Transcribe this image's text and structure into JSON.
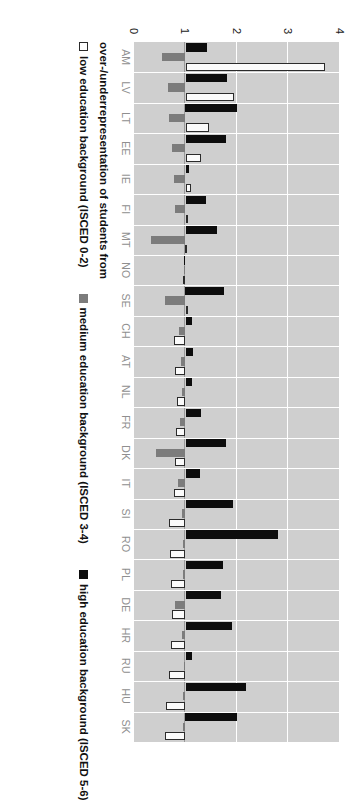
{
  "chart_data": {
    "type": "bar",
    "orientation": "rotated-vertical",
    "title": "",
    "xlabel": "",
    "ylabel": "over-/underrepresentation of students from",
    "axis_title": "over-/underrepresentation of students from",
    "ylim": [
      0,
      4
    ],
    "yticks": [
      0,
      1,
      2,
      3,
      4
    ],
    "ytick_labels": [
      "0",
      "1",
      "2",
      "3",
      "4"
    ],
    "grid": true,
    "baseline": 1,
    "legend_position": "bottom",
    "categories": [
      "AM",
      "LV",
      "LT",
      "EE",
      "IE",
      "FI",
      "MT",
      "NO",
      "SE",
      "CH",
      "AT",
      "NL",
      "FR",
      "DK",
      "IT",
      "SI",
      "RO",
      "PL",
      "DE",
      "HR",
      "RU",
      "HU",
      "SK"
    ],
    "series": [
      {
        "name": "low education background (ISCED 0-2)",
        "key": "low",
        "color": "#ffffff",
        "edge_color": "#2b2b2b",
        "values": [
          3.7,
          1.95,
          1.45,
          1.3,
          1.1,
          1.05,
          1.02,
          1.0,
          1.04,
          0.78,
          0.8,
          0.84,
          0.82,
          0.8,
          0.78,
          0.68,
          0.7,
          0.72,
          0.74,
          0.72,
          0.68,
          0.62,
          0.6
        ]
      },
      {
        "name": "medium education background (ISCED 3-4)",
        "key": "med",
        "color": "#7c7c7c",
        "values": [
          0.55,
          0.66,
          0.68,
          0.74,
          0.78,
          0.8,
          0.33,
          0.97,
          0.6,
          0.88,
          0.92,
          0.93,
          0.9,
          0.42,
          0.85,
          0.93,
          0.95,
          0.96,
          0.8,
          0.94,
          0.98,
          0.95,
          0.96
        ]
      },
      {
        "name": "high education background (ISCED 5-6)",
        "key": "high",
        "color": "#0d0d0d",
        "values": [
          1.42,
          1.8,
          2.0,
          1.78,
          1.06,
          1.4,
          1.62,
          1.0,
          1.75,
          1.12,
          1.15,
          1.12,
          1.3,
          1.78,
          1.28,
          1.92,
          2.8,
          1.72,
          1.68,
          1.9,
          1.12,
          2.18,
          2.0
        ]
      }
    ]
  },
  "value_axis": {
    "ticks": [
      "0",
      "1",
      "2",
      "3",
      "4"
    ]
  },
  "axis_title": {
    "text": "over-/underrepresentation of students from"
  },
  "legend": {
    "items": [
      {
        "label": "low education background (ISCED 0-2)",
        "swatch": "low-swatch"
      },
      {
        "label": "medium education background (ISCED 3-4)",
        "swatch": "medium-swatch"
      },
      {
        "label": "high education background (ISCED 5-6)",
        "swatch": "high-swatch"
      }
    ]
  }
}
